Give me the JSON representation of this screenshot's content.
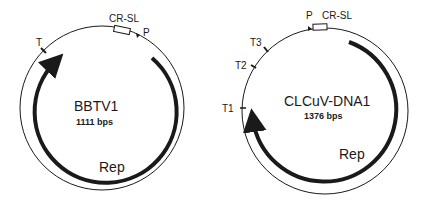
{
  "colors": {
    "line": "#1a1a1a",
    "background": "#ffffff",
    "box_fill": "#ffffff"
  },
  "maps": [
    {
      "id": "bbtv1",
      "name": "BBTV1",
      "size": "1111 bps",
      "gene": "Rep",
      "features": {
        "cr_sl": "CR-SL",
        "promoter": "P",
        "terminators": [
          "T"
        ]
      }
    },
    {
      "id": "clcuv-dna1",
      "name": "CLCuV-DNA1",
      "size": "1376 bps",
      "gene": "Rep",
      "features": {
        "cr_sl": "CR-SL",
        "promoter": "P",
        "terminators": [
          "T3",
          "T2",
          "T1"
        ]
      }
    }
  ]
}
